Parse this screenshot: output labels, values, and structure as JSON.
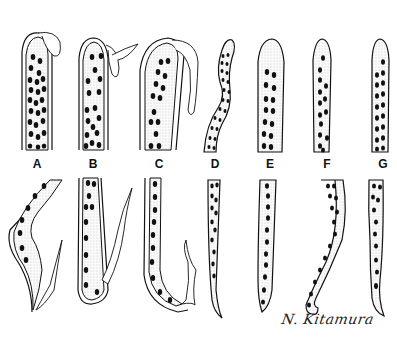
{
  "figure": {
    "type": "scientific-illustration",
    "panels": [
      {
        "id": "A",
        "label": "A"
      },
      {
        "id": "B",
        "label": "B"
      },
      {
        "id": "C",
        "label": "C"
      },
      {
        "id": "D",
        "label": "D"
      },
      {
        "id": "E",
        "label": "E"
      },
      {
        "id": "F",
        "label": "F"
      },
      {
        "id": "G",
        "label": "G"
      }
    ],
    "signature": "N. Kitamura",
    "colors": {
      "ink": "#111111",
      "stipple_fill": "#efefef",
      "background": "#ffffff"
    }
  }
}
